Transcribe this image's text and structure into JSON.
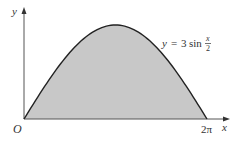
{
  "chart_data": {
    "type": "area",
    "title": "",
    "function": "y = 3 sin(x/2)",
    "equation_label": {
      "y": "y",
      "eq": "=",
      "coef": "3",
      "fn": "sin",
      "num": "x",
      "den": "2"
    },
    "xlabel": "x",
    "ylabel": "y",
    "origin_label": "O",
    "x_ticks": [
      {
        "value": 6.2832,
        "label": "2π"
      }
    ],
    "xlim": [
      0,
      6.2832
    ],
    "ylim": [
      0,
      3
    ],
    "x": [
      0,
      0.785,
      1.571,
      2.356,
      3.1416,
      3.927,
      4.712,
      5.498,
      6.2832
    ],
    "values": [
      0,
      1.148,
      2.121,
      2.772,
      3.0,
      2.772,
      2.121,
      1.148,
      0
    ],
    "shaded_region": {
      "from": 0,
      "to": 6.2832,
      "fill": "#c8c8c8"
    },
    "curve_color": "#222222",
    "axis_color": "#555555",
    "grid": false,
    "legend": null
  }
}
